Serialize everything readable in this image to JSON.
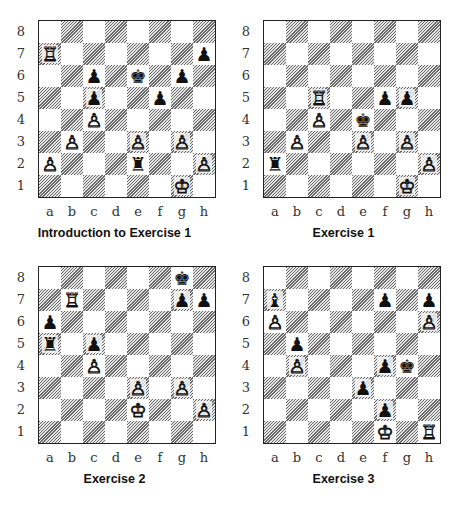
{
  "files": [
    "a",
    "b",
    "c",
    "d",
    "e",
    "f",
    "g",
    "h"
  ],
  "ranks": [
    "8",
    "7",
    "6",
    "5",
    "4",
    "3",
    "2",
    "1"
  ],
  "diagrams": [
    {
      "caption": "Introduction to Exercise 1",
      "pieces": {
        "a7": "wR",
        "h7": "bP",
        "c6": "bP",
        "e6": "bK",
        "g6": "bP",
        "c5": "bP",
        "f5": "bP",
        "c4": "wP",
        "b3": "wP",
        "e3": "wP",
        "g3": "wP",
        "a2": "wP",
        "e2": "bR",
        "h2": "wP",
        "g1": "wK"
      }
    },
    {
      "caption": "Exercise 1",
      "pieces": {
        "c5": "wR",
        "f5": "bP",
        "g5": "bP",
        "c4": "wP",
        "e4": "bK",
        "b3": "wP",
        "e3": "wP",
        "g3": "wP",
        "a2": "bR",
        "h2": "wP",
        "g1": "wK"
      }
    },
    {
      "caption": "Exercise 2",
      "pieces": {
        "g8": "bK",
        "b7": "wR",
        "g7": "bP",
        "h7": "bP",
        "a6": "bP",
        "a5": "bR",
        "c5": "bP",
        "c4": "wP",
        "e3": "wP",
        "g3": "wP",
        "e2": "wK",
        "h2": "wP"
      }
    },
    {
      "caption": "Exercise 3",
      "pieces": {
        "a7": "bB",
        "f7": "bP",
        "h7": "bP",
        "a6": "wP",
        "h6": "wP",
        "b5": "bP",
        "b4": "wP",
        "f4": "bP",
        "g4": "bK",
        "e3": "bP",
        "f2": "bP",
        "f1": "wK",
        "h1": "wR"
      }
    }
  ],
  "glyphs": {
    "wK": "♔",
    "wQ": "♕",
    "wR": "♖",
    "wB": "♗",
    "wN": "♘",
    "wP": "♙",
    "bK": "♚",
    "bQ": "♛",
    "bR": "♜",
    "bB": "♝",
    "bN": "♞",
    "bP": "♟"
  },
  "footer_fragment": "The 1 li"
}
